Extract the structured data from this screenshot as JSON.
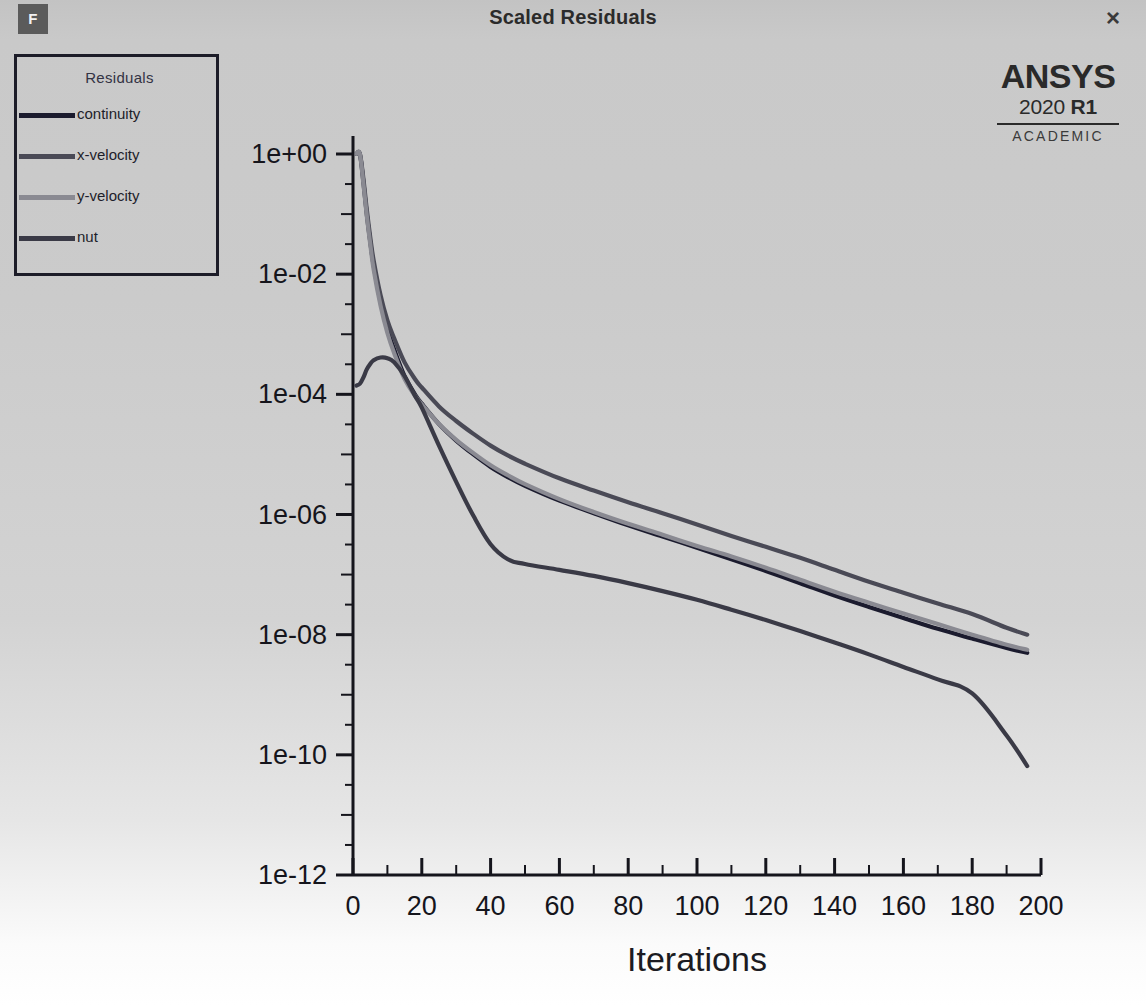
{
  "window": {
    "badge": "F",
    "title": "Scaled Residuals",
    "close_icon": "×"
  },
  "branding": {
    "name": "ANSYS",
    "version_year": "2020",
    "version_release": "R1",
    "license": "ACADEMIC"
  },
  "legend": {
    "title": "Residuals",
    "items": [
      {
        "label": "continuity",
        "color": "#1b1b2e"
      },
      {
        "label": "x-velocity",
        "color": "#4a4a56"
      },
      {
        "label": "y-velocity",
        "color": "#8a8a92"
      },
      {
        "label": "nut",
        "color": "#3a3a46"
      }
    ]
  },
  "chart_data": {
    "type": "line",
    "title": "Scaled Residuals",
    "xlabel": "Iterations",
    "ylabel": "",
    "xlim": [
      0,
      200
    ],
    "ylim": [
      1e-12,
      1
    ],
    "yscale": "log",
    "xscale": "linear",
    "grid": false,
    "legend_position": "top-left",
    "xticks": [
      0,
      20,
      40,
      60,
      80,
      100,
      120,
      140,
      160,
      180,
      200
    ],
    "xtick_labels": [
      "0",
      "20",
      "40",
      "60",
      "80",
      "100",
      "120",
      "140",
      "160",
      "180",
      "200"
    ],
    "yticks": [
      1,
      0.01,
      0.0001,
      1e-06,
      1e-08,
      1e-10,
      1e-12
    ],
    "ytick_labels": [
      "1e+00",
      "1e-02",
      "1e-04",
      "1e-06",
      "1e-08",
      "1e-10",
      "1e-12"
    ],
    "x": [
      1,
      2,
      3,
      4,
      5,
      6,
      8,
      10,
      12,
      15,
      18,
      20,
      25,
      30,
      35,
      40,
      45,
      50,
      60,
      70,
      80,
      90,
      100,
      110,
      120,
      130,
      140,
      150,
      160,
      170,
      180,
      190,
      196
    ],
    "series": [
      {
        "name": "continuity",
        "color": "#1b1b2e",
        "values": [
          1.0,
          1.0,
          0.35,
          0.1,
          0.035,
          0.014,
          0.0035,
          0.0012,
          0.00055,
          0.0002,
          0.0001,
          7e-05,
          3.2e-05,
          1.7e-05,
          1e-05,
          6.2e-06,
          4.2e-06,
          3e-06,
          1.7e-06,
          1.05e-06,
          6.6e-07,
          4.3e-07,
          2.8e-07,
          1.8e-07,
          1.15e-07,
          7.2e-08,
          4.5e-08,
          2.9e-08,
          1.9e-08,
          1.25e-08,
          8.6e-09,
          6e-09,
          5e-09
        ]
      },
      {
        "name": "x-velocity",
        "color": "#4a4a56",
        "values": [
          1.0,
          1.0,
          0.4,
          0.12,
          0.042,
          0.017,
          0.0045,
          0.0017,
          0.00085,
          0.00034,
          0.00018,
          0.00013,
          6.3e-05,
          3.6e-05,
          2.2e-05,
          1.4e-05,
          9.6e-06,
          7e-06,
          4e-06,
          2.5e-06,
          1.6e-06,
          1.05e-06,
          6.8e-07,
          4.4e-07,
          2.9e-07,
          1.9e-07,
          1.2e-07,
          7.6e-08,
          5e-08,
          3.3e-08,
          2.2e-08,
          1.3e-08,
          1e-08
        ]
      },
      {
        "name": "y-velocity",
        "color": "#8a8a92",
        "values": [
          1.0,
          1.0,
          0.33,
          0.095,
          0.032,
          0.012,
          0.003,
          0.00105,
          0.00048,
          0.00018,
          9.5e-05,
          6.8e-05,
          3.2e-05,
          1.75e-05,
          1.05e-05,
          6.6e-06,
          4.5e-06,
          3.2e-06,
          1.8e-06,
          1.1e-06,
          7e-07,
          4.6e-07,
          3e-07,
          2e-07,
          1.3e-07,
          8.2e-08,
          5.2e-08,
          3.4e-08,
          2.25e-08,
          1.5e-08,
          1e-08,
          6.8e-09,
          5.6e-09
        ]
      },
      {
        "name": "nut",
        "color": "#3a3a46",
        "values": [
          0.00014,
          0.00015,
          0.00019,
          0.00026,
          0.00032,
          0.00037,
          0.00041,
          0.0004,
          0.00034,
          0.0002,
          9.5e-05,
          6e-05,
          1.4e-05,
          3.5e-06,
          9.5e-07,
          3.2e-07,
          1.8e-07,
          1.5e-07,
          1.2e-07,
          9.5e-08,
          7.2e-08,
          5.3e-08,
          3.8e-08,
          2.6e-08,
          1.75e-08,
          1.15e-08,
          7.4e-09,
          4.7e-09,
          2.9e-09,
          1.8e-09,
          1.05e-09,
          2.1e-10,
          6.5e-11
        ]
      }
    ]
  }
}
